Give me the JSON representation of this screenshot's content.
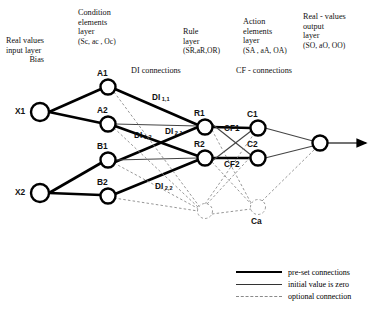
{
  "diagram": {
    "headers": {
      "input": {
        "line1": "Real values",
        "line2": "input layer",
        "line3": "Bias"
      },
      "condition": {
        "line1": "Condition",
        "line2": "elements",
        "line3": "layer",
        "tuple": "(Sc, ac , Oc)"
      },
      "rule": {
        "line1": "Rule",
        "line2": "layer",
        "tuple": "(SR,aR,OR)"
      },
      "action": {
        "line1": "Action",
        "line2": "elements",
        "line3": "layer",
        "tuple": "(SA , aA, OA)"
      },
      "output": {
        "line1": "Real - values",
        "line2": "output",
        "line3": "layer",
        "tuple": "(SO, aO, OO)"
      }
    },
    "annotations": {
      "di_connections": "DI connections",
      "cf_connections": "CF - connections"
    },
    "nodes": [
      {
        "id": "X1",
        "label": "X1",
        "x": 40,
        "y": 112,
        "r": 9,
        "style": "solid",
        "label_pos": "left"
      },
      {
        "id": "X2",
        "label": "X2",
        "x": 40,
        "y": 193,
        "r": 9,
        "style": "solid",
        "label_pos": "left"
      },
      {
        "id": "A1",
        "label": "A1",
        "x": 108,
        "y": 87,
        "r": 7.5,
        "style": "solid",
        "label_pos": "above"
      },
      {
        "id": "A2",
        "label": "A2",
        "x": 108,
        "y": 124,
        "r": 7.5,
        "style": "solid",
        "label_pos": "above"
      },
      {
        "id": "B1",
        "label": "B1",
        "x": 108,
        "y": 160,
        "r": 7.5,
        "style": "solid",
        "label_pos": "above"
      },
      {
        "id": "B2",
        "label": "B2",
        "x": 108,
        "y": 196,
        "r": 7.5,
        "style": "solid",
        "label_pos": "above"
      },
      {
        "id": "R1",
        "label": "R1",
        "x": 205,
        "y": 127,
        "r": 7.5,
        "style": "solid",
        "label_pos": "above"
      },
      {
        "id": "R2",
        "label": "R2",
        "x": 205,
        "y": 158,
        "r": 7.5,
        "style": "solid",
        "label_pos": "above"
      },
      {
        "id": "Ra",
        "label": "",
        "x": 205,
        "y": 211,
        "r": 7.5,
        "style": "dashed",
        "label_pos": "none"
      },
      {
        "id": "C1",
        "label": "C1",
        "x": 258,
        "y": 128,
        "r": 7.5,
        "style": "solid",
        "label_pos": "above"
      },
      {
        "id": "C2",
        "label": "C2",
        "x": 258,
        "y": 158,
        "r": 7.5,
        "style": "solid",
        "label_pos": "above"
      },
      {
        "id": "Ca",
        "label": "Ca",
        "x": 258,
        "y": 207,
        "r": 7.5,
        "style": "dashed",
        "label_pos": "below"
      },
      {
        "id": "O1",
        "label": "",
        "x": 320,
        "y": 143,
        "r": 7.5,
        "style": "solid",
        "label_pos": "none"
      }
    ],
    "edge_labels": [
      {
        "text": "DI",
        "sub": "1,1",
        "x": 152,
        "y": 93
      },
      {
        "text": "DI",
        "sub": "1,2",
        "x": 134,
        "y": 131
      },
      {
        "text": "DI",
        "sub": "2,1",
        "x": 165,
        "y": 127
      },
      {
        "text": "DI",
        "sub": "2,2",
        "x": 155,
        "y": 182
      },
      {
        "text": "CF1",
        "sub": "",
        "x": 224,
        "y": 124
      },
      {
        "text": "CF2",
        "sub": "",
        "x": 224,
        "y": 160
      }
    ],
    "legend": [
      {
        "style": "preset",
        "label": "pre-set connections"
      },
      {
        "style": "zero",
        "label": "initial value is zero"
      },
      {
        "style": "optional",
        "label": "optional connection"
      }
    ]
  }
}
